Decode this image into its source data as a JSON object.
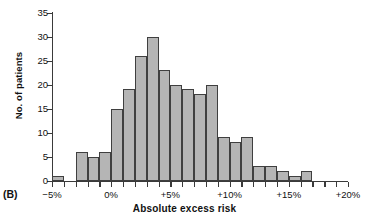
{
  "panel_label": "(B)",
  "chart_data": {
    "type": "bar",
    "title": "",
    "subtitle": "",
    "xlabel": "Absolute excess risk",
    "ylabel": "No. of patients",
    "grid": false,
    "legend": "none",
    "ylim": [
      0,
      35
    ],
    "ytick_values": [
      0,
      5,
      10,
      15,
      20,
      25,
      30,
      35
    ],
    "ytick_labels": [
      "0",
      "5",
      "10",
      "15",
      "20",
      "25",
      "30",
      "35"
    ],
    "xlim": [
      -5,
      20
    ],
    "xtick_values": [
      -5,
      0,
      5,
      10,
      15,
      20
    ],
    "xtick_labels": [
      "−5%",
      "0%",
      "+5%",
      "+10%",
      "+15%",
      "+20%"
    ],
    "xtick_minor_values": [
      -4,
      -3,
      -2,
      -1,
      1,
      2,
      3,
      4,
      6,
      7,
      8,
      9,
      11,
      12,
      13,
      14,
      16,
      17,
      18,
      19
    ],
    "bin_width": 1,
    "bin_unit": "%",
    "bar_fill": "#b5b5b5",
    "bar_edge": "#3f3f3f",
    "categories": [
      "-5%",
      "-4%",
      "-3%",
      "-2%",
      "-1%",
      "0%",
      "+1%",
      "+2%",
      "+3%",
      "+4%",
      "+5%",
      "+6%",
      "+7%",
      "+8%",
      "+9%",
      "+10%",
      "+11%",
      "+12%",
      "+13%",
      "+14%",
      "+15%",
      "+16%"
    ],
    "bins": [
      {
        "start": -5,
        "end": -4,
        "value": 1
      },
      {
        "start": -4,
        "end": -3,
        "value": 0
      },
      {
        "start": -3,
        "end": -2,
        "value": 6
      },
      {
        "start": -2,
        "end": -1,
        "value": 5
      },
      {
        "start": -1,
        "end": 0,
        "value": 6
      },
      {
        "start": 0,
        "end": 1,
        "value": 15
      },
      {
        "start": 1,
        "end": 2,
        "value": 19
      },
      {
        "start": 2,
        "end": 3,
        "value": 26
      },
      {
        "start": 3,
        "end": 4,
        "value": 30
      },
      {
        "start": 4,
        "end": 5,
        "value": 23
      },
      {
        "start": 5,
        "end": 6,
        "value": 20
      },
      {
        "start": 6,
        "end": 7,
        "value": 19
      },
      {
        "start": 7,
        "end": 8,
        "value": 18
      },
      {
        "start": 8,
        "end": 9,
        "value": 20
      },
      {
        "start": 9,
        "end": 10,
        "value": 9
      },
      {
        "start": 10,
        "end": 11,
        "value": 8
      },
      {
        "start": 11,
        "end": 12,
        "value": 9
      },
      {
        "start": 12,
        "end": 13,
        "value": 3
      },
      {
        "start": 13,
        "end": 14,
        "value": 3
      },
      {
        "start": 14,
        "end": 15,
        "value": 2
      },
      {
        "start": 15,
        "end": 16,
        "value": 1
      },
      {
        "start": 16,
        "end": 17,
        "value": 2
      }
    ],
    "values": [
      1,
      0,
      6,
      5,
      6,
      15,
      19,
      26,
      30,
      23,
      20,
      19,
      18,
      20,
      9,
      8,
      9,
      3,
      3,
      2,
      1,
      2
    ]
  }
}
